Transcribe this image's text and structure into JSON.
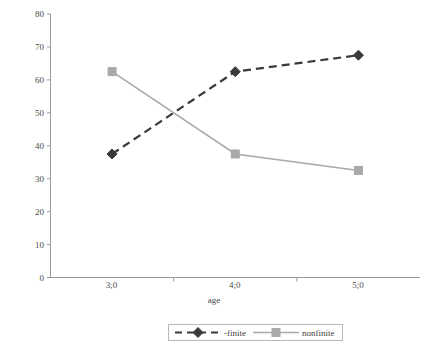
{
  "chart_data": {
    "type": "line",
    "title": "",
    "xlabel": "age",
    "ylabel": "proportion",
    "categories": [
      "3;0",
      "4;0",
      "5;0"
    ],
    "ylim": [
      0,
      80
    ],
    "ytick_step": 10,
    "yticks": [
      "0",
      "10",
      "20",
      "30",
      "40",
      "50",
      "60",
      "70",
      "80"
    ],
    "grid": false,
    "legend_position": "bottom",
    "series": [
      {
        "name": "-finite",
        "values": [
          37.5,
          62.5,
          67.5
        ],
        "color": "#3a3a3a",
        "line_style": "dashed",
        "marker": "diamond"
      },
      {
        "name": "nonfinite",
        "values": [
          62.5,
          37.5,
          32.5
        ],
        "color": "#a9a9a9",
        "line_style": "solid",
        "marker": "square"
      }
    ]
  },
  "legend": {
    "items": [
      {
        "label": "-finite"
      },
      {
        "label": "nonfinite"
      }
    ]
  },
  "axes": {
    "y_label": "proportion",
    "x_label": "age",
    "axis_color": "#9a9a9a"
  }
}
